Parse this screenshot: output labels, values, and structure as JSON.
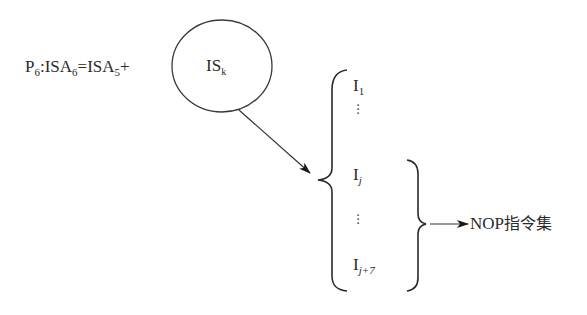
{
  "equation": {
    "p": "P",
    "p_sub": "6",
    "colon": ":",
    "isa_left": "ISA",
    "isa_left_sub": "6",
    "equals": "=",
    "isa_right": "ISA",
    "isa_right_sub": "5",
    "plus": "+"
  },
  "circle_node": {
    "label": "IS",
    "label_sub": "k"
  },
  "instruction_list": {
    "items": [
      {
        "base": "I",
        "sub": "1"
      },
      {
        "base": "I",
        "sub": "j"
      },
      {
        "base": "I",
        "sub": "j+7"
      }
    ],
    "ellipsis": "⋮"
  },
  "target": {
    "label": "NOP",
    "label_cjk": "指令集"
  },
  "colors": {
    "stroke": "#2a2a2a",
    "background": "#ffffff"
  }
}
